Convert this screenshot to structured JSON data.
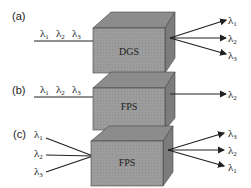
{
  "panels": [
    {
      "label": "(a)",
      "device": "DGS",
      "inputs": [
        {
          "sym": "λ",
          "sub": "1"
        },
        {
          "sym": "λ",
          "sub": "2"
        },
        {
          "sym": "λ",
          "sub": "3"
        }
      ],
      "outputs": [
        {
          "sym": "λ",
          "sub": "1"
        },
        {
          "sym": "λ",
          "sub": "2"
        },
        {
          "sym": "λ",
          "sub": "3"
        }
      ]
    },
    {
      "label": "(b)",
      "device": "FPS",
      "inputs": [
        {
          "sym": "λ",
          "sub": "1"
        },
        {
          "sym": "λ",
          "sub": "2"
        },
        {
          "sym": "λ",
          "sub": "3"
        }
      ],
      "outputs": [
        {
          "sym": "λ",
          "sub": "2"
        }
      ]
    },
    {
      "label": "(c)",
      "device": "FPS",
      "inputs": [
        {
          "sym": "λ",
          "sub": "1"
        },
        {
          "sym": "λ",
          "sub": "2"
        },
        {
          "sym": "λ",
          "sub": "3"
        }
      ],
      "outputs": [
        {
          "sym": "λ",
          "sub": "3"
        },
        {
          "sym": "λ",
          "sub": "2"
        },
        {
          "sym": "λ",
          "sub": "1"
        }
      ]
    }
  ],
  "colors": {
    "box_front": "#9a9a9a",
    "box_top": "#8a8a8a",
    "box_side": "#7a7a7a",
    "line": "#222222"
  }
}
